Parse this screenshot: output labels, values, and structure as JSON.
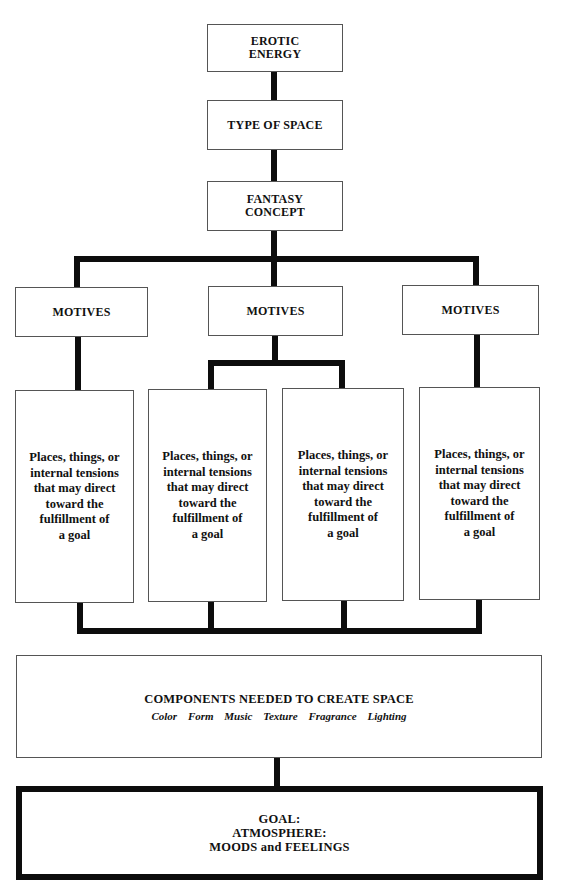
{
  "diagram": {
    "top_chain": [
      {
        "label_lines": [
          "EROTIC",
          "ENERGY"
        ]
      },
      {
        "label_lines": [
          "TYPE OF SPACE"
        ]
      },
      {
        "label_lines": [
          "FANTASY",
          "CONCEPT"
        ]
      }
    ],
    "motives": [
      {
        "label": "MOTIVES"
      },
      {
        "label": "MOTIVES"
      },
      {
        "label": "MOTIVES"
      }
    ],
    "detail_boxes": [
      {
        "lines": [
          "Places, things, or",
          "internal tensions",
          "that may direct",
          "toward the",
          "fulfillment of",
          "a goal"
        ]
      },
      {
        "lines": [
          "Places, things, or",
          "internal tensions",
          "that may direct",
          "toward the",
          "fulfillment of",
          "a goal"
        ]
      },
      {
        "lines": [
          "Places, things, or",
          "internal tensions",
          "that may direct",
          "toward the",
          "fulfillment of",
          "a goal"
        ]
      },
      {
        "lines": [
          "Places, things, or",
          "internal tensions",
          "that may direct",
          "toward the",
          "fulfillment of",
          "a goal"
        ]
      }
    ],
    "components": {
      "title": "COMPONENTS NEEDED TO CREATE SPACE",
      "items": [
        "Color",
        "Form",
        "Music",
        "Texture",
        "Fragrance",
        "Lighting"
      ]
    },
    "goal": {
      "lines": [
        "GOAL:",
        "ATMOSPHERE:",
        "MOODS and FEELINGS"
      ]
    },
    "colors": {
      "line": "#0d0d0d",
      "box_border": "#555555",
      "background": "#ffffff"
    }
  }
}
